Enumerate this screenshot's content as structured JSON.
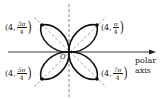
{
  "diagram": {
    "type": "polar rose curve",
    "curve": "four-leaved rose",
    "colors": {
      "curve": "#111111",
      "axes": "#333333",
      "dashed": "#666666",
      "background": "#ffffff"
    },
    "origin_label": "O",
    "axis_label_line1": "polar",
    "axis_label_line2": "axis",
    "points": [
      {
        "id": "pi_over_4",
        "prefix": "(4,",
        "num": "π",
        "den": "4",
        "suffix": ")"
      },
      {
        "id": "3pi_over_4",
        "prefix": "(4,",
        "num": "3π",
        "den": "4",
        "suffix": ")"
      },
      {
        "id": "5pi_over_4",
        "prefix": "(4,",
        "num": "5π",
        "den": "4",
        "suffix": ")"
      },
      {
        "id": "7pi_over_4",
        "prefix": "(4,",
        "num": "7π",
        "den": "4",
        "suffix": ")"
      }
    ]
  }
}
